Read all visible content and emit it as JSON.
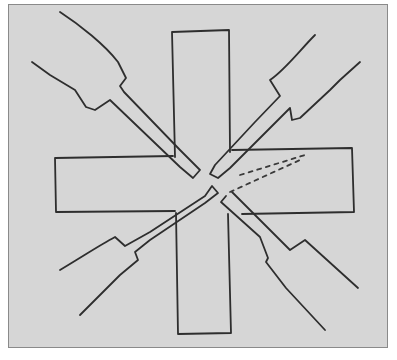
{
  "figure": {
    "background_color": "#d6d6d6",
    "stroke_color": "#2e2e2e",
    "elements": [
      {
        "name": "vertical-bar",
        "shape": "rectangle"
      },
      {
        "name": "horizontal-bar",
        "shape": "rectangle"
      },
      {
        "name": "probe-top-left",
        "direction": "NW"
      },
      {
        "name": "probe-top-right",
        "direction": "NE"
      },
      {
        "name": "probe-bottom-left",
        "direction": "SW"
      },
      {
        "name": "probe-bottom-right",
        "direction": "SE"
      },
      {
        "name": "dashed-lines",
        "count": 2
      }
    ]
  }
}
